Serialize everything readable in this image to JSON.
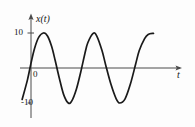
{
  "figure": {
    "background_color": "#fdfdfd",
    "line_color": "#1a1a1a",
    "axis_color": "#4a4a4a",
    "text_color": "#171717"
  },
  "axes": {
    "y_axis_label": "x(t)",
    "x_axis_label": "t",
    "origin_label": "0",
    "y_tick_positive": "10",
    "y_tick_negative": "-10"
  },
  "chart_data": {
    "type": "line",
    "title": "",
    "xlabel": "t",
    "ylabel": "x(t)",
    "ylim": [
      -13,
      13
    ],
    "xlim": [
      -0.15,
      3.9
    ],
    "grid": false,
    "legend": null,
    "yticks": [
      10,
      0,
      -10
    ],
    "ytick_labels": [
      "10",
      "0",
      "-10"
    ],
    "xticks": [],
    "xtick_labels": [],
    "series": [
      {
        "name": "x(t)",
        "description": "sinusoid of amplitude 10, two and a quarter cycles, rising through zero near t=0",
        "amplitude": 10,
        "period": 1.83,
        "x": [
          -0.25,
          -0.1,
          0.0,
          0.1,
          0.22,
          0.35,
          0.46,
          0.58,
          0.68,
          0.8,
          0.92,
          1.05,
          1.15,
          1.28,
          1.4,
          1.52,
          1.6,
          1.75,
          1.85,
          2.0,
          2.1,
          2.25,
          2.4,
          2.5,
          2.65,
          2.8,
          2.95,
          3.05,
          3.2,
          3.3,
          3.45
        ],
        "y": [
          -9.0,
          -3.4,
          1.4,
          5.6,
          8.8,
          10.0,
          9.2,
          6.2,
          2.2,
          -3.0,
          -7.6,
          -10.0,
          -9.4,
          -6.0,
          -1.2,
          4.2,
          7.2,
          9.9,
          9.2,
          5.0,
          1.0,
          -4.6,
          -8.8,
          -10.0,
          -8.8,
          -4.6,
          1.2,
          5.0,
          8.4,
          9.6,
          9.9
        ]
      }
    ]
  }
}
